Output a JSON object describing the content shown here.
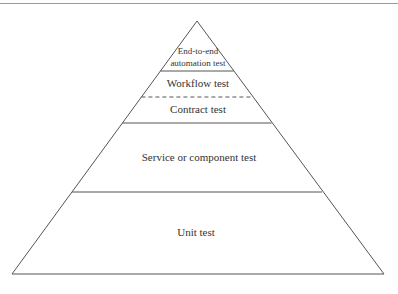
{
  "diagram": {
    "type": "test-pyramid",
    "stroke_color": "#555555",
    "text_color": "#333333",
    "layers": [
      {
        "label_line1": "End-to-end",
        "label_line2": "automation test",
        "separator_below": "solid"
      },
      {
        "label": "Workflow test",
        "separator_below": "dashed"
      },
      {
        "label": "Contract test",
        "separator_below": "solid"
      },
      {
        "label": "Service or component test",
        "separator_below": "solid"
      },
      {
        "label": "Unit test",
        "separator_below": "base"
      }
    ]
  }
}
